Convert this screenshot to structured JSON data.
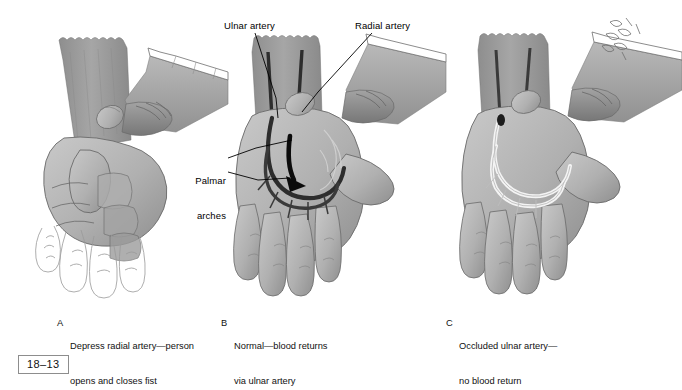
{
  "figure": {
    "number": "18–13",
    "background_color": "#ffffff",
    "ink_color": "#000000",
    "skin_gray": "#b4b4b4",
    "forearm_gray": "#9a9a9a",
    "artery_dark": "#2a2a2a",
    "artery_empty": "#f2f2f2",
    "box_border_color": "#8d8d8d"
  },
  "annotations": [
    {
      "id": "ulnar-artery",
      "text": "Ulnar artery"
    },
    {
      "id": "radial-artery",
      "text": "Radial artery"
    },
    {
      "id": "palmar-arches",
      "line1": "Palmar",
      "line2": "arches"
    }
  ],
  "panels": [
    {
      "letter": "A",
      "caption_line1": "Depress radial artery—person",
      "caption_line2": "opens and closes fist",
      "state": "fist-closed",
      "artery_fill": "none",
      "has_ghost_outline_fingers": true
    },
    {
      "letter": "B",
      "caption_line1": "Normal—blood returns",
      "caption_line2": "via ulnar artery",
      "state": "hand-open",
      "artery_fill": "dark",
      "has_flow_arrow": true
    },
    {
      "letter": "C",
      "caption_line1": "Occluded ulnar artery—",
      "caption_line2": "no blood return",
      "state": "hand-open-pale",
      "artery_fill": "empty",
      "has_flow_arrow": false
    }
  ]
}
